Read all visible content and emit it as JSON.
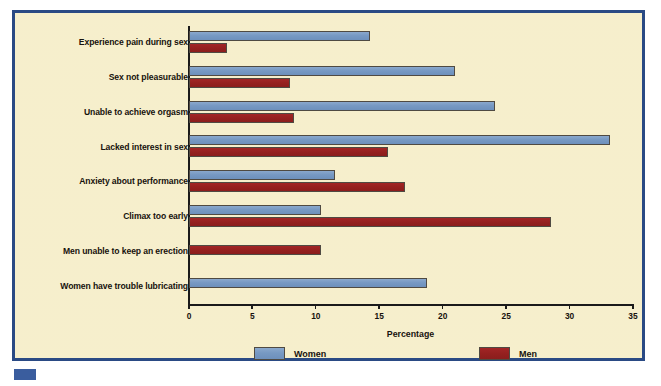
{
  "chart_data": {
    "type": "bar",
    "orientation": "horizontal",
    "title": "",
    "xlabel": "Percentage",
    "ylabel": "",
    "xlim": [
      0,
      35
    ],
    "xticks": [
      0,
      5,
      10,
      15,
      20,
      25,
      30,
      35
    ],
    "grid": false,
    "legend_position": "bottom",
    "categories": [
      "Experience pain during sex",
      "Sex not pleasurable",
      "Unable to achieve orgasm",
      "Lacked interest in sex",
      "Anxiety about performance",
      "Climax too early",
      "Men unable to keep an erection",
      "Women have trouble lubricating"
    ],
    "series": [
      {
        "name": "Women",
        "color": "#7799c3",
        "values": [
          14.3,
          21.0,
          24.1,
          33.2,
          11.5,
          10.4,
          null,
          18.8
        ]
      },
      {
        "name": "Men",
        "color": "#95201f",
        "values": [
          3.0,
          8.0,
          8.3,
          15.7,
          17.0,
          28.5,
          10.4,
          null
        ]
      }
    ]
  },
  "figure": {
    "frame_color": "#2a4a84",
    "background_color": "#f6eeca",
    "axis_color": "#1a1a1a"
  },
  "legend": {
    "items": [
      {
        "label": "Women",
        "swatch": "women-swatch"
      },
      {
        "label": "Men",
        "swatch": "men-swatch"
      }
    ]
  }
}
